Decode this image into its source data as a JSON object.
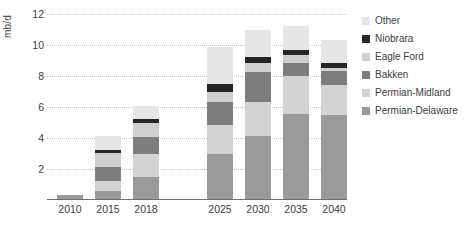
{
  "chart_data": {
    "type": "bar",
    "stacked": true,
    "title": "",
    "xlabel": "",
    "ylabel": "mb/d",
    "ylim": [
      0,
      12
    ],
    "ytick_labels": [
      "2",
      "4",
      "6",
      "8",
      "10",
      "12"
    ],
    "ytick_values": [
      2,
      4,
      6,
      8,
      10,
      12
    ],
    "grid": true,
    "legend_position": "right",
    "categories": [
      "2010",
      "2015",
      "2018",
      "2025",
      "2030",
      "2035",
      "2040"
    ],
    "series": [
      {
        "name": "Permian-Delaware",
        "color": "#9a9a9a",
        "values": [
          0.35,
          0.55,
          1.5,
          3.0,
          4.1,
          5.55,
          5.5
        ]
      },
      {
        "name": "Permian-Midland",
        "color": "#d3d3d3",
        "values": [
          0.0,
          0.65,
          1.45,
          1.85,
          2.2,
          2.45,
          1.9
        ]
      },
      {
        "name": "Bakken",
        "color": "#7d7d7d",
        "values": [
          0.0,
          0.95,
          1.1,
          1.45,
          1.95,
          0.85,
          0.95
        ]
      },
      {
        "name": "Eagle Ford",
        "color": "#cfcfcf",
        "values": [
          0.0,
          0.9,
          0.9,
          0.65,
          0.6,
          0.5,
          0.2
        ]
      },
      {
        "name": "Niobrara",
        "color": "#262626",
        "values": [
          0.0,
          0.2,
          0.25,
          0.55,
          0.4,
          0.35,
          0.3
        ]
      },
      {
        "name": "Other",
        "color": "#e6e6e6",
        "values": [
          0.0,
          0.9,
          0.85,
          2.4,
          1.7,
          1.55,
          1.45
        ]
      }
    ],
    "totals": [
      0.35,
      4.15,
      6.05,
      9.9,
      10.95,
      11.25,
      10.3
    ]
  },
  "legend": {
    "items": [
      {
        "label": "Other",
        "color": "#e6e6e6"
      },
      {
        "label": "Niobrara",
        "color": "#262626"
      },
      {
        "label": "Eagle Ford",
        "color": "#cfcfcf"
      },
      {
        "label": "Bakken",
        "color": "#7d7d7d"
      },
      {
        "label": "Permian-Midland",
        "color": "#d3d3d3"
      },
      {
        "label": "Permian-Delaware",
        "color": "#9a9a9a"
      }
    ]
  }
}
